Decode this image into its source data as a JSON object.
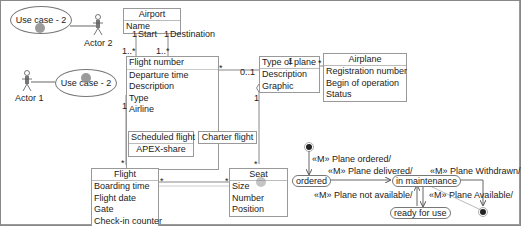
{
  "use_cases": [
    {
      "label": "Use case - 2"
    },
    {
      "label": "Use case - 2"
    }
  ],
  "actors": [
    {
      "label": "Actor 2"
    },
    {
      "label": "Actor 1"
    }
  ],
  "classes": {
    "airport": {
      "name": "Airport",
      "attributes": [
        "Name"
      ]
    },
    "flight_route": {
      "name": "",
      "attributes": [
        "Flight number",
        "Departure time",
        "Description",
        "Type",
        "Airline"
      ]
    },
    "type_of_plane": {
      "name": "Type of plane",
      "attributes": [
        "Description",
        "Graphic"
      ]
    },
    "airplane": {
      "name": "Airplane",
      "attributes": [
        "Registration number",
        "Begin of operation",
        "Status"
      ]
    },
    "scheduled_flight": {
      "name": "Scheduled flight",
      "attributes": [
        "APEX-share"
      ]
    },
    "charter_flight": {
      "name": "Charter flight",
      "attributes": []
    },
    "flight": {
      "name": "Flight",
      "attributes": [
        "Boarding time",
        "Flight date",
        "Gate",
        "Check-in counter"
      ]
    },
    "seat": {
      "name": "Seat",
      "attributes": [
        "Size",
        "Number",
        "Position"
      ]
    }
  },
  "multiplicities": {
    "start_one": "1",
    "start_role": "Start",
    "dest_one": "1",
    "dest_role": "Destination",
    "start_many": "1..*",
    "dest_many": "1..*",
    "airline_one": "1",
    "route_type_many": "*",
    "route_type_opt": "0..1",
    "type_airplane_one": "1",
    "type_airplane_many": "*",
    "type_seat_one": "1",
    "type_seat_many": "*",
    "flight_many": "*",
    "flight_seat_many_a": "*",
    "flight_seat_many_b": "*"
  },
  "states": {
    "ordered": "ordered",
    "in_maintenance": "in maintenance",
    "ready_for_use": "ready for use"
  },
  "transitions": {
    "plane_ordered": "«M» Plane ordered/",
    "plane_delivered": "«M» Plane delivered/",
    "plane_withdrawn": "«M» Plane Withdrawn/",
    "plane_not_available": "«M» Plane not available/",
    "plane_available": "«M» Plane Available/"
  }
}
